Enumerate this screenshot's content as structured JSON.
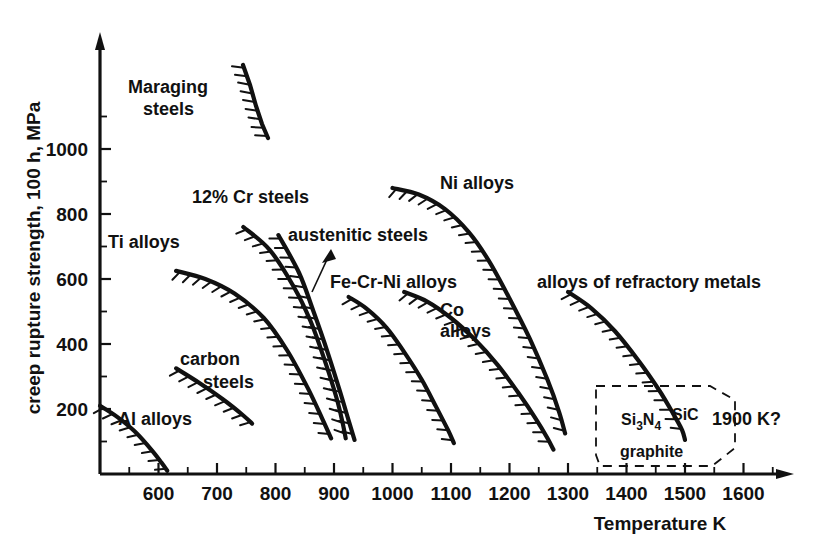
{
  "chart_data": {
    "type": "line",
    "title": "",
    "xlabel": "Temperature  K",
    "ylabel": "creep rupture strength, 100 h, MPa",
    "xlim": [
      500,
      1650
    ],
    "ylim": [
      0,
      1180
    ],
    "grid": false,
    "legend_position": "inline-annotations",
    "x_ticks_major": [
      600,
      700,
      800,
      900,
      1000,
      1100,
      1200,
      1300,
      1400,
      1500,
      1600
    ],
    "x_tick_labels": [
      "600",
      "700",
      "800",
      "900",
      "1000",
      "1100",
      "1200",
      "1300",
      "1400",
      "1500",
      "1600"
    ],
    "x_ticks_minor": [
      550,
      650,
      750,
      850,
      950,
      1050,
      1150,
      1250,
      1350,
      1450,
      1550,
      1650
    ],
    "y_ticks_major": [
      200,
      400,
      600,
      800,
      1000
    ],
    "y_tick_labels": [
      "200",
      "400",
      "600",
      "800",
      "1000"
    ],
    "y_ticks_minor": [
      100,
      300,
      500,
      700,
      900,
      1100
    ],
    "series": [
      {
        "name": "Al alloys",
        "label": "Al  alloys",
        "hatch_side": "below",
        "points": [
          [
            500,
            210
          ],
          [
            530,
            175
          ],
          [
            560,
            130
          ],
          [
            590,
            70
          ],
          [
            605,
            35
          ],
          [
            615,
            10
          ]
        ]
      },
      {
        "name": "carbon steels",
        "label_line1": "carbon",
        "label_line2": "steels",
        "hatch_side": "below",
        "points": [
          [
            630,
            325
          ],
          [
            670,
            280
          ],
          [
            710,
            230
          ],
          [
            745,
            180
          ],
          [
            760,
            155
          ]
        ]
      },
      {
        "name": "Ti alloys",
        "label": "Ti  alloys",
        "hatch_side": "below",
        "points": [
          [
            630,
            625
          ],
          [
            680,
            600
          ],
          [
            730,
            555
          ],
          [
            780,
            480
          ],
          [
            820,
            380
          ],
          [
            855,
            265
          ],
          [
            880,
            170
          ],
          [
            895,
            110
          ]
        ]
      },
      {
        "name": "12% Cr steels",
        "label": "12%  Cr  steels",
        "hatch_side": "below",
        "points": [
          [
            745,
            760
          ],
          [
            790,
            690
          ],
          [
            830,
            580
          ],
          [
            860,
            470
          ],
          [
            885,
            345
          ],
          [
            905,
            230
          ],
          [
            915,
            155
          ],
          [
            920,
            110
          ]
        ]
      },
      {
        "name": "austenitic steels",
        "label": "austenitic  steels",
        "hatch_side": "below",
        "points": [
          [
            805,
            735
          ],
          [
            840,
            620
          ],
          [
            865,
            500
          ],
          [
            890,
            370
          ],
          [
            910,
            255
          ],
          [
            925,
            165
          ],
          [
            935,
            105
          ]
        ]
      },
      {
        "name": "Fe-Cr-Ni alloys",
        "label": "Fe-Cr-Ni  alloys",
        "hatch_side": "below",
        "points": [
          [
            925,
            545
          ],
          [
            955,
            510
          ],
          [
            990,
            450
          ],
          [
            1020,
            375
          ],
          [
            1050,
            290
          ],
          [
            1075,
            205
          ],
          [
            1095,
            135
          ],
          [
            1105,
            95
          ]
        ]
      },
      {
        "name": "Ni alloys",
        "label": "Ni  alloys",
        "hatch_side": "below",
        "points": [
          [
            1000,
            880
          ],
          [
            1045,
            860
          ],
          [
            1090,
            815
          ],
          [
            1130,
            745
          ],
          [
            1165,
            655
          ],
          [
            1200,
            540
          ],
          [
            1235,
            415
          ],
          [
            1265,
            290
          ],
          [
            1285,
            190
          ],
          [
            1295,
            125
          ]
        ]
      },
      {
        "name": "Co alloys",
        "label_line1": "Co",
        "label_line2": "alloys",
        "hatch_side": "below",
        "points": [
          [
            1020,
            560
          ],
          [
            1060,
            530
          ],
          [
            1100,
            480
          ],
          [
            1140,
            415
          ],
          [
            1180,
            335
          ],
          [
            1215,
            250
          ],
          [
            1245,
            170
          ],
          [
            1265,
            110
          ],
          [
            1275,
            75
          ]
        ]
      },
      {
        "name": "alloys of refractory metals",
        "label": "alloys  of  refractory  metals",
        "hatch_side": "below",
        "points": [
          [
            1300,
            560
          ],
          [
            1340,
            510
          ],
          [
            1380,
            440
          ],
          [
            1420,
            350
          ],
          [
            1455,
            260
          ],
          [
            1480,
            185
          ],
          [
            1495,
            135
          ],
          [
            1500,
            105
          ]
        ]
      }
    ],
    "ceramics_region": {
      "labels": [
        "Si",
        "3",
        "N",
        "4",
        "SiC",
        "graphite"
      ],
      "si3n4": "Si3N4",
      "sic": "SiC",
      "graphite": "graphite",
      "annotation": "1900  K?",
      "x_range": [
        1410,
        1610
      ],
      "y_range": [
        0,
        165
      ]
    }
  },
  "axis": {
    "y_title": "creep rupture strength, 100 h, MPa",
    "x_title": "Temperature   K"
  }
}
